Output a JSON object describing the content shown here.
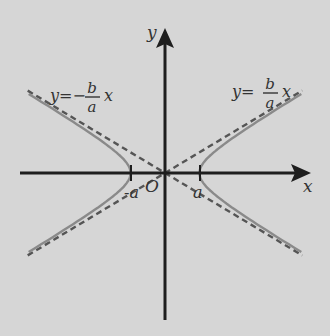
{
  "colors": {
    "background": "#d6d6d6",
    "axis": "#1e1e1e",
    "curve": "#8a8a8a",
    "asymptote": "#555555",
    "label": "#333333"
  },
  "axes": {
    "x_label": "x",
    "y_label": "y",
    "origin_label": "O"
  },
  "vertices": {
    "left_label": "-a",
    "right_label": "a"
  },
  "asymptotes": {
    "negative": {
      "lhs": "y=−",
      "num": "b",
      "den": "a",
      "var": "x"
    },
    "positive": {
      "lhs": "y=",
      "num": "b",
      "den": "a",
      "var": "x"
    }
  },
  "chart_data": {
    "type": "line",
    "title": "",
    "xlabel": "x",
    "ylabel": "y",
    "a": 1,
    "b": 0.6,
    "xlim": [
      -4.1,
      4.1
    ],
    "ylim": [
      -4.2,
      4.2
    ],
    "series": [
      {
        "name": "hyperbola right branch",
        "equation": "x^2/a^2 - y^2/b^2 = 1, x>0"
      },
      {
        "name": "hyperbola left branch",
        "equation": "x^2/a^2 - y^2/b^2 = 1, x<0"
      },
      {
        "name": "asymptote y = b/a x",
        "style": "dashed"
      },
      {
        "name": "asymptote y = -b/a x",
        "style": "dashed"
      }
    ]
  }
}
